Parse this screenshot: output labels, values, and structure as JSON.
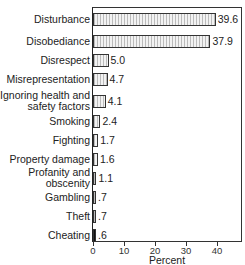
{
  "chart_data": {
    "type": "bar",
    "orientation": "horizontal",
    "title": "",
    "xlabel": "Percent",
    "ylabel": "",
    "xlim": [
      0,
      48
    ],
    "xticks": [
      0,
      10,
      20,
      30,
      40
    ],
    "xtick_labels": [
      "0",
      "10",
      "20",
      "30",
      "40"
    ],
    "grid": false,
    "legend": null,
    "categories": [
      "Disturbance",
      "Disobediance",
      "Disrespect",
      "Misrepresentation",
      "Ignoring health and\nsafety factors",
      "Smoking",
      "Fighting",
      "Property damage",
      "Profanity and\nobscenity",
      "Gambling",
      "Theft",
      "Cheating"
    ],
    "values": [
      39.6,
      37.9,
      5.0,
      4.7,
      4.1,
      2.4,
      1.7,
      1.6,
      1.1,
      0.7,
      0.7,
      0.6
    ],
    "value_labels": [
      "39.6",
      "37.9",
      "5.0",
      "4.7",
      "4.1",
      "2.4",
      "1.7",
      "1.6",
      "1.1",
      ".7",
      ".7",
      ".6"
    ]
  }
}
